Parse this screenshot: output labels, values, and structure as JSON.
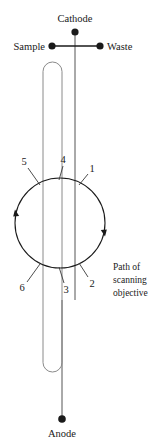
{
  "figure": {
    "title_alt": "Capillary electrophoresis chip schematic with scanning objective path",
    "background": "#ffffff",
    "stroke": "#4a4a4a",
    "dark_stroke": "#1a1a1a",
    "text_color": "#1a1a1a"
  },
  "terminals": {
    "cathode": {
      "label": "Cathode",
      "x": 75,
      "y": 32
    },
    "sample": {
      "label": "Sample",
      "x": 52,
      "y": 46
    },
    "waste": {
      "label": "Waste",
      "x": 100,
      "y": 46
    },
    "anode": {
      "label": "Anode",
      "x": 62,
      "y": 419
    }
  },
  "callout": {
    "line1": "Path of",
    "line2": "scanning",
    "line3": "objective"
  },
  "markers": [
    {
      "id": "1",
      "label": "1",
      "tx": 92,
      "ty": 170,
      "lx1": 88,
      "ly1": 174,
      "lx2": 79,
      "ly2": 183
    },
    {
      "id": "2",
      "label": "2",
      "tx": 91,
      "ty": 284,
      "lx1": 87,
      "ly1": 280,
      "lx2": 79,
      "ly2": 266
    },
    {
      "id": "3",
      "label": "3",
      "tx": 66,
      "ty": 289,
      "lx1": 64,
      "ly1": 284,
      "lx2": 61,
      "ly2": 268
    },
    {
      "id": "4",
      "label": "4",
      "tx": 63,
      "ty": 161,
      "lx1": 63,
      "ly1": 165,
      "lx2": 61,
      "ly2": 179
    },
    {
      "id": "5",
      "label": "5",
      "tx": 24,
      "ty": 163,
      "lx1": 28,
      "ly1": 167,
      "lx2": 41,
      "ly2": 184
    },
    {
      "id": "6",
      "label": "6",
      "tx": 22,
      "ty": 288,
      "lx1": 26,
      "ly1": 284,
      "lx2": 40,
      "ly2": 266
    }
  ],
  "circle": {
    "cx": 60,
    "cy": 223,
    "r": 45
  },
  "capillary": {
    "x": 43,
    "y": 62,
    "width": 19,
    "height": 310,
    "radius": 9
  },
  "channel_line": {
    "x": 75,
    "y_top": 32,
    "y_bottom": 300
  },
  "anode_line": {
    "x": 62,
    "y_top": 300,
    "y_bottom": 419
  }
}
